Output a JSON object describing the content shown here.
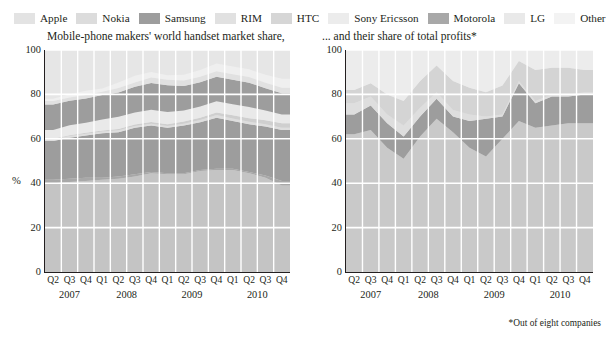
{
  "legend": {
    "items": [
      {
        "label": "Apple",
        "color": "#e3e3e3"
      },
      {
        "label": "Nokia",
        "color": "#dcdcdc"
      },
      {
        "label": "Samsung",
        "color": "#9d9d9d"
      },
      {
        "label": "RIM",
        "color": "#e1e1e1"
      },
      {
        "label": "HTC",
        "color": "#d6d6d6"
      },
      {
        "label": "Sony Ericsson",
        "color": "#ececec"
      },
      {
        "label": "Motorola",
        "color": "#a8a8a8"
      },
      {
        "label": "LG",
        "color": "#e9e9e9"
      },
      {
        "label": "Other",
        "color": "#f3f3f3"
      }
    ]
  },
  "footnote": "*Out of eight companies",
  "chart_data": [
    {
      "type": "area",
      "id": "market-share",
      "title": "Mobile-phone makers' world handset market share,",
      "xlabel": "",
      "ylabel": "%",
      "ylim": [
        0,
        100
      ],
      "yticks": [
        0,
        20,
        40,
        60,
        80,
        100
      ],
      "grid": true,
      "legend_position": "top",
      "stacked": true,
      "categories": [
        "Q2",
        "Q3",
        "Q4",
        "Q1",
        "Q2",
        "Q3",
        "Q4",
        "Q1",
        "Q2",
        "Q3",
        "Q4",
        "Q1",
        "Q2",
        "Q3",
        "Q4"
      ],
      "year_groups": [
        {
          "label": "2007",
          "span": 3
        },
        {
          "label": "2008",
          "span": 4
        },
        {
          "label": "2009",
          "span": 4
        },
        {
          "label": "2010",
          "span": 4
        }
      ],
      "series": [
        {
          "name": "Other",
          "color": "#c4c4c4",
          "values": [
            40,
            40.5,
            41,
            41.5,
            42,
            43,
            44.5,
            44,
            44,
            45.5,
            46,
            46,
            44.5,
            42.5,
            39
          ]
        },
        {
          "name": "Motorola",
          "color": "#a8a8a8",
          "values": [
            1.5,
            1.5,
            1.5,
            1,
            1,
            1,
            0.5,
            0.5,
            0.5,
            0.5,
            0.5,
            0.5,
            0.5,
            1,
            2
          ]
        },
        {
          "name": "Nokia",
          "color": "#9d9d9d",
          "values": [
            17.5,
            18.5,
            19,
            20,
            20,
            21,
            21,
            20.5,
            21.5,
            21.5,
            23,
            21.5,
            21.5,
            22,
            23
          ]
        },
        {
          "name": "Sony Ericsson",
          "color": "#dedede",
          "values": [
            0.8,
            0.8,
            0.8,
            0.8,
            0.8,
            0.8,
            0.8,
            0.8,
            0.8,
            1,
            1.2,
            1.2,
            1.2,
            1,
            1
          ]
        },
        {
          "name": "HTC",
          "color": "#cfcfcf",
          "values": [
            0.2,
            0.3,
            0.4,
            0.4,
            0.6,
            0.6,
            0.8,
            0.8,
            1,
            1,
            1.2,
            1.4,
            1.6,
            1.8,
            2
          ]
        },
        {
          "name": "LG",
          "color": "#e9e9e9",
          "values": [
            4,
            4.5,
            4.5,
            5,
            5.5,
            5.5,
            5.5,
            5.5,
            5,
            5,
            5,
            5,
            5,
            4.5,
            4
          ]
        },
        {
          "name": "Samsung",
          "color": "#9d9d9d",
          "values": [
            11.5,
            11,
            11,
            11,
            11,
            11.5,
            12,
            12,
            11,
            11,
            11,
            11,
            11,
            10,
            9.5
          ]
        },
        {
          "name": "RIM",
          "color": "#e1e1e1",
          "values": [
            1.5,
            1.5,
            1.5,
            1.5,
            2,
            2,
            2.5,
            2.5,
            2.5,
            2.5,
            2.5,
            2.5,
            2.5,
            2.5,
            2.5
          ]
        },
        {
          "name": "Apple",
          "color": "#efefef",
          "values": [
            1,
            1.5,
            2,
            1.5,
            2.5,
            3,
            2.5,
            2,
            2.5,
            3,
            3.5,
            3.5,
            3.5,
            3.5,
            4
          ]
        }
      ]
    },
    {
      "type": "area",
      "id": "profit-share",
      "title": "... and their share of total profits*",
      "xlabel": "",
      "ylabel": "%",
      "ylim": [
        0,
        100
      ],
      "yticks": [
        0,
        20,
        40,
        60,
        80,
        100
      ],
      "grid": true,
      "legend_position": "top",
      "stacked": true,
      "categories": [
        "Q2",
        "Q3",
        "Q4",
        "Q1",
        "Q2",
        "Q3",
        "Q4",
        "Q1",
        "Q2",
        "Q3",
        "Q4",
        "Q1",
        "Q2",
        "Q3",
        "Q4"
      ],
      "year_groups": [
        {
          "label": "2007",
          "span": 3
        },
        {
          "label": "2008",
          "span": 4
        },
        {
          "label": "2009",
          "span": 4
        },
        {
          "label": "2010",
          "span": 4
        }
      ],
      "series": [
        {
          "name": "Other",
          "color": "#c9c9c9",
          "values": [
            62,
            64,
            56,
            51,
            61,
            69,
            63,
            56,
            52,
            60,
            68,
            65,
            66,
            67,
            67
          ]
        },
        {
          "name": "Nokia",
          "color": "#9d9d9d",
          "values": [
            9,
            11,
            11,
            10,
            9,
            9,
            7,
            12,
            17,
            10,
            17,
            11,
            13,
            12,
            13
          ]
        },
        {
          "name": "Sony Ericsson",
          "color": "#dedede",
          "values": [
            5,
            4,
            4,
            5,
            4,
            3,
            3,
            3,
            1,
            1,
            1,
            1,
            1,
            1,
            1
          ]
        },
        {
          "name": "HTC",
          "color": "#d4d4d4",
          "values": [
            6,
            6,
            9,
            11,
            12,
            12,
            13,
            12,
            11,
            13,
            9,
            14,
            12,
            12,
            10
          ]
        },
        {
          "name": "Apple",
          "color": "#ececec",
          "values": [
            18,
            15,
            20,
            23,
            14,
            7,
            14,
            17,
            19,
            16,
            5,
            9,
            8,
            8,
            9
          ]
        }
      ]
    }
  ]
}
